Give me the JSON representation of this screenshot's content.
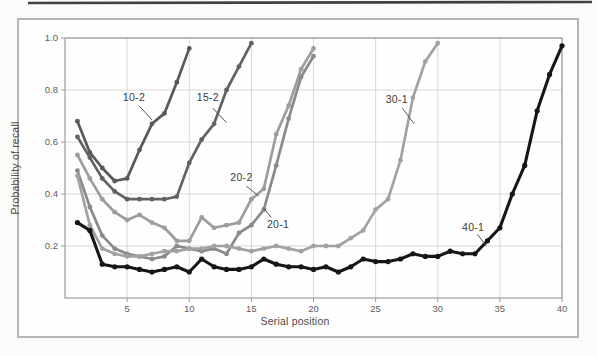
{
  "figure": {
    "x_axis_title": "Serial position",
    "y_axis_title": "Probability of recall"
  },
  "chart_data": {
    "type": "line",
    "title": "",
    "xlabel": "Serial position",
    "ylabel": "Probability of recall",
    "xlim": [
      0,
      40
    ],
    "ylim": [
      0,
      1.0
    ],
    "x_ticks": [
      5,
      10,
      15,
      20,
      25,
      30,
      35,
      40
    ],
    "y_ticks": [
      0.2,
      0.4,
      0.6,
      0.8,
      1.0
    ],
    "y_tick_labels": [
      "0.2",
      "0.4",
      "0.6",
      "0.8",
      "1.0"
    ],
    "grid": true,
    "legend_position": "none",
    "colors": {
      "grid": "#d9d9d9",
      "axis_border": "#9b9b9b",
      "frame": "#b4b4b4",
      "leader_line": "#555555",
      "scan_line": "#414141"
    },
    "series": [
      {
        "name": "10-2",
        "color": "#59595b",
        "line_width": 2.7,
        "x": [
          1,
          2,
          3,
          4,
          5,
          6,
          7,
          8,
          9,
          10
        ],
        "values": [
          0.68,
          0.56,
          0.5,
          0.45,
          0.46,
          0.57,
          0.67,
          0.71,
          0.83,
          0.96
        ]
      },
      {
        "name": "15-2",
        "color": "#626264",
        "line_width": 2.7,
        "x": [
          1,
          2,
          3,
          4,
          5,
          6,
          7,
          8,
          9,
          10,
          11,
          12,
          13,
          14,
          15
        ],
        "values": [
          0.62,
          0.54,
          0.46,
          0.41,
          0.38,
          0.38,
          0.38,
          0.38,
          0.39,
          0.52,
          0.61,
          0.67,
          0.8,
          0.89,
          0.98
        ]
      },
      {
        "name": "20-2",
        "color": "#9d9d9f",
        "line_width": 2.7,
        "x": [
          1,
          2,
          3,
          4,
          5,
          6,
          7,
          8,
          9,
          10,
          11,
          12,
          13,
          14,
          15,
          16,
          17,
          18,
          19,
          20
        ],
        "values": [
          0.55,
          0.46,
          0.38,
          0.33,
          0.3,
          0.32,
          0.29,
          0.27,
          0.22,
          0.22,
          0.31,
          0.27,
          0.28,
          0.29,
          0.38,
          0.42,
          0.63,
          0.74,
          0.88,
          0.96
        ]
      },
      {
        "name": "20-1",
        "color": "#8a8a8c",
        "line_width": 2.7,
        "x": [
          1,
          2,
          3,
          4,
          5,
          6,
          7,
          8,
          9,
          10,
          11,
          12,
          13,
          14,
          15,
          16,
          17,
          18,
          19,
          20
        ],
        "values": [
          0.49,
          0.35,
          0.24,
          0.19,
          0.17,
          0.16,
          0.15,
          0.16,
          0.2,
          0.19,
          0.18,
          0.19,
          0.17,
          0.25,
          0.28,
          0.34,
          0.51,
          0.69,
          0.85,
          0.93
        ]
      },
      {
        "name": "30-1",
        "color": "#a2a2a4",
        "line_width": 2.7,
        "x": [
          1,
          2,
          3,
          4,
          5,
          6,
          7,
          8,
          9,
          10,
          11,
          12,
          13,
          14,
          15,
          16,
          17,
          18,
          19,
          20,
          21,
          22,
          23,
          24,
          25,
          26,
          27,
          28,
          29,
          30
        ],
        "values": [
          0.47,
          0.28,
          0.19,
          0.17,
          0.16,
          0.16,
          0.17,
          0.18,
          0.18,
          0.19,
          0.19,
          0.2,
          0.2,
          0.19,
          0.18,
          0.19,
          0.2,
          0.19,
          0.18,
          0.2,
          0.2,
          0.2,
          0.23,
          0.26,
          0.34,
          0.38,
          0.53,
          0.77,
          0.91,
          0.98
        ]
      },
      {
        "name": "40-1",
        "color": "#161616",
        "line_width": 3.1,
        "x": [
          1,
          2,
          3,
          4,
          5,
          6,
          7,
          8,
          9,
          10,
          11,
          12,
          13,
          14,
          15,
          16,
          17,
          18,
          19,
          20,
          21,
          22,
          23,
          24,
          25,
          26,
          27,
          28,
          29,
          30,
          31,
          32,
          33,
          34,
          35,
          36,
          37,
          38,
          39,
          40
        ],
        "values": [
          0.29,
          0.26,
          0.13,
          0.12,
          0.12,
          0.11,
          0.1,
          0.11,
          0.12,
          0.1,
          0.15,
          0.12,
          0.11,
          0.11,
          0.12,
          0.15,
          0.13,
          0.12,
          0.12,
          0.11,
          0.12,
          0.1,
          0.12,
          0.15,
          0.14,
          0.14,
          0.15,
          0.17,
          0.16,
          0.16,
          0.18,
          0.17,
          0.17,
          0.22,
          0.27,
          0.4,
          0.51,
          0.72,
          0.86,
          0.97
        ]
      }
    ],
    "annotations": [
      {
        "label": "10-2",
        "x": 5.55,
        "y": 0.773,
        "leader": [
          5.95,
          0.74,
          7.0,
          0.685
        ]
      },
      {
        "label": "15-2",
        "x": 11.5,
        "y": 0.77,
        "leader": [
          11.9,
          0.73,
          13.0,
          0.675
        ]
      },
      {
        "label": "20-2",
        "x": 14.2,
        "y": 0.462,
        "leader": [
          14.6,
          0.43,
          15.6,
          0.392
        ]
      },
      {
        "label": "20-1",
        "x": 17.15,
        "y": 0.281,
        "leader": [
          16.6,
          0.31,
          15.95,
          0.348
        ]
      },
      {
        "label": "30-1",
        "x": 26.7,
        "y": 0.762,
        "leader": [
          27.15,
          0.73,
          28.1,
          0.67
        ]
      },
      {
        "label": "40-1",
        "x": 32.85,
        "y": 0.273,
        "leader": [
          33.2,
          0.245,
          33.9,
          0.2
        ]
      }
    ]
  }
}
